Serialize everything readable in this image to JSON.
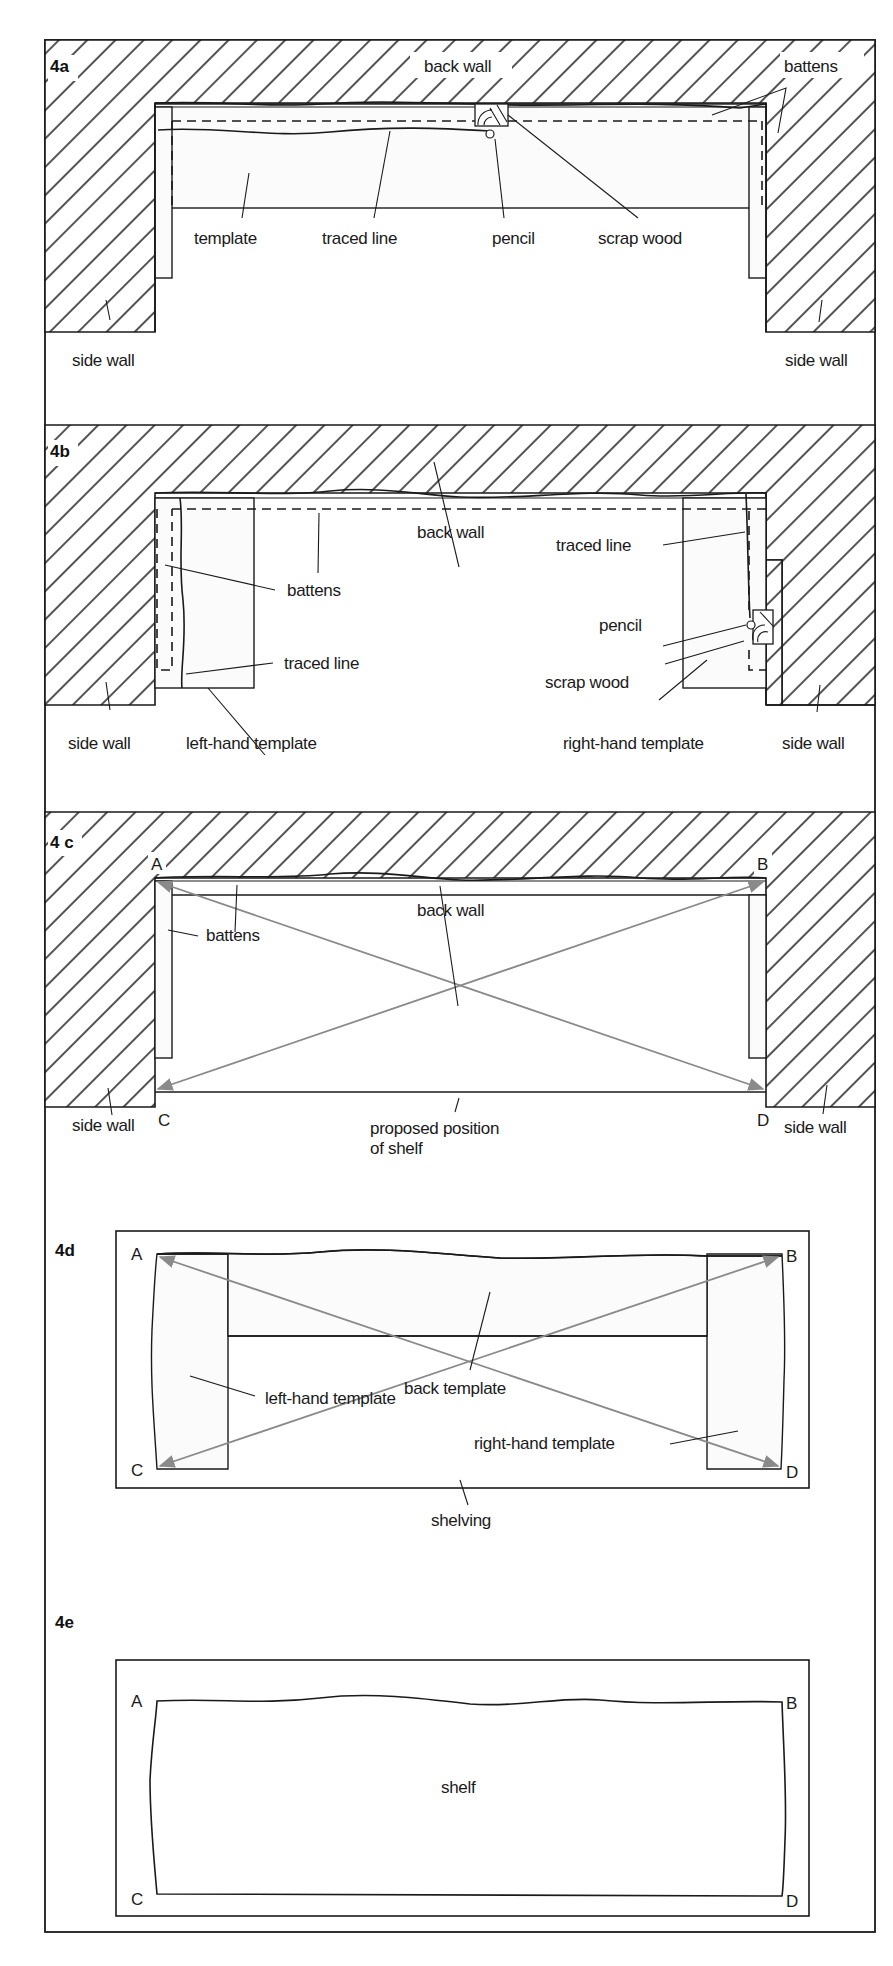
{
  "figure": {
    "colors": {
      "line": "#1a1a1a",
      "arrow": "#8a8a8a",
      "hatch": "#1a1a1a",
      "background": "#ffffff"
    }
  },
  "panels": {
    "p4a": {
      "id": "4a",
      "labels": {
        "back_wall": "back wall",
        "battens": "battens",
        "template": "template",
        "traced_line": "traced line",
        "pencil": "pencil",
        "scrap_wood": "scrap wood",
        "side_wall_left": "side wall",
        "side_wall_right": "side wall"
      }
    },
    "p4b": {
      "id": "4b",
      "labels": {
        "back_wall": "back wall",
        "battens": "battens",
        "traced_line_left": "traced line",
        "traced_line_right": "traced line",
        "pencil": "pencil",
        "scrap_wood": "scrap wood",
        "left_template": "left-hand template",
        "right_template": "right-hand template",
        "side_wall_left": "side wall",
        "side_wall_right": "side wall"
      }
    },
    "p4c": {
      "id": "4 c",
      "labels": {
        "back_wall": "back wall",
        "battens": "battens",
        "proposed_line1": "proposed position",
        "proposed_line2": "of shelf",
        "side_wall_left": "side wall",
        "side_wall_right": "side wall"
      },
      "corners": {
        "a": "A",
        "b": "B",
        "c": "C",
        "d": "D"
      }
    },
    "p4d": {
      "id": "4d",
      "labels": {
        "back_template": "back template",
        "left_template": "left-hand template",
        "right_template": "right-hand template",
        "shelving": "shelving"
      },
      "corners": {
        "a": "A",
        "b": "B",
        "c": "C",
        "d": "D"
      }
    },
    "p4e": {
      "id": "4e",
      "labels": {
        "shelf": "shelf"
      },
      "corners": {
        "a": "A",
        "b": "B",
        "c": "C",
        "d": "D"
      }
    }
  }
}
